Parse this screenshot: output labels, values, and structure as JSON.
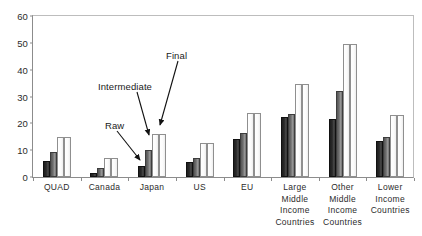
{
  "chart_data": {
    "type": "bar",
    "title": "",
    "clipped_title": "",
    "xlabel": "",
    "ylabel": "",
    "ylim": [
      0,
      60
    ],
    "yticks": [
      0,
      10,
      20,
      30,
      40,
      50,
      60
    ],
    "grid": false,
    "legend_position": "none",
    "categories": [
      "QUAD",
      "Canada",
      "Japan",
      "US",
      "EU",
      "Large Middle Income Countries",
      "Other Middle Income Countries",
      "Lower Income Countries"
    ],
    "category_lines": [
      [
        "QUAD"
      ],
      [
        "Canada"
      ],
      [
        "Japan"
      ],
      [
        "US"
      ],
      [
        "EU"
      ],
      [
        "Large",
        "Middle",
        "Income",
        "Countries"
      ],
      [
        "Other",
        "Middle",
        "Income",
        "Countries"
      ],
      [
        "Lower",
        "Income",
        "Countries"
      ]
    ],
    "series": [
      {
        "name": "Raw",
        "color": "#222222",
        "values": [
          6,
          1.5,
          4,
          5.5,
          14,
          22.5,
          21.5,
          13.5
        ]
      },
      {
        "name": "Intermediate",
        "color": "#777777",
        "values": [
          9.5,
          3.5,
          10,
          7,
          16.5,
          23.5,
          32,
          15
        ]
      },
      {
        "name": "Final",
        "color": "#ffffff",
        "values": [
          15,
          7,
          16,
          12.5,
          24,
          34.5,
          49.5,
          23
        ]
      },
      {
        "name": "Final2",
        "color": "#ffffff",
        "values": [
          15,
          7,
          16,
          12.5,
          24,
          34.5,
          49.5,
          23
        ]
      }
    ],
    "annotations": [
      {
        "label": "Raw",
        "points_to": "Japan raw bar"
      },
      {
        "label": "Intermediate",
        "points_to": "Japan intermediate bar"
      },
      {
        "label": "Final",
        "points_to": "Japan final bar"
      }
    ]
  }
}
